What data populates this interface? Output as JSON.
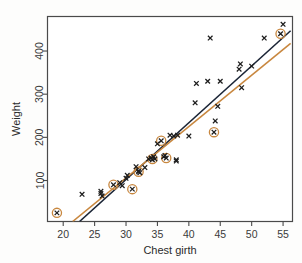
{
  "chart_data": {
    "type": "scatter",
    "title": "",
    "xlabel": "Chest girth",
    "ylabel": "Weight",
    "xlim": [
      17.5,
      56.5
    ],
    "ylim": [
      5,
      480
    ],
    "xticks": [
      20,
      25,
      30,
      35,
      40,
      45,
      50,
      55
    ],
    "yticks": [
      100,
      200,
      300,
      400
    ],
    "grid": false,
    "legend": "none",
    "marker": "x-cross",
    "point_color": "#1c1c1c",
    "highlight_ring_color": "#c8873f",
    "series": [
      {
        "name": "observations",
        "x": [
          19.0,
          23.0,
          26.0,
          26.0,
          26.2,
          28.0,
          29.0,
          29.4,
          30.0,
          30.2,
          31.0,
          31.6,
          32.0,
          32.0,
          32.2,
          33.0,
          33.6,
          34.0,
          34.2,
          34.4,
          34.6,
          35.0,
          35.6,
          36.0,
          36.2,
          36.4,
          37.0,
          37.6,
          38.0,
          38.0,
          38.2,
          40.0,
          41.0,
          41.2,
          43.0,
          43.4,
          44.0,
          44.2,
          44.6,
          45.0,
          48.0,
          48.2,
          48.4,
          50.0,
          52.0,
          54.6,
          55.0
        ],
        "y": [
          25,
          68,
          70,
          75,
          64,
          90,
          95,
          88,
          105,
          112,
          80,
          132,
          120,
          122,
          118,
          130,
          150,
          152,
          148,
          155,
          150,
          185,
          192,
          155,
          158,
          152,
          205,
          203,
          145,
          148,
          205,
          203,
          280,
          325,
          330,
          430,
          212,
          238,
          272,
          330,
          358,
          370,
          315,
          365,
          430,
          440,
          462
        ]
      }
    ],
    "highlighted_points": [
      {
        "x": 19.0,
        "y": 25
      },
      {
        "x": 28.0,
        "y": 90
      },
      {
        "x": 31.0,
        "y": 80
      },
      {
        "x": 32.0,
        "y": 120
      },
      {
        "x": 34.2,
        "y": 150
      },
      {
        "x": 35.6,
        "y": 192
      },
      {
        "x": 36.4,
        "y": 152
      },
      {
        "x": 44.0,
        "y": 212
      },
      {
        "x": 54.6,
        "y": 440
      }
    ],
    "lines": [
      {
        "name": "ols-fit-dark",
        "color": "#1b2536",
        "x0": 22.6,
        "y0": 5,
        "x1": 56.2,
        "y1": 447
      },
      {
        "name": "robust-fit-orange",
        "color": "#c8873f",
        "x0": 21.5,
        "y0": 5,
        "x1": 56.2,
        "y1": 418
      }
    ]
  },
  "axes": {
    "ylabel": "Weight",
    "xlabel": "Chest girth"
  }
}
